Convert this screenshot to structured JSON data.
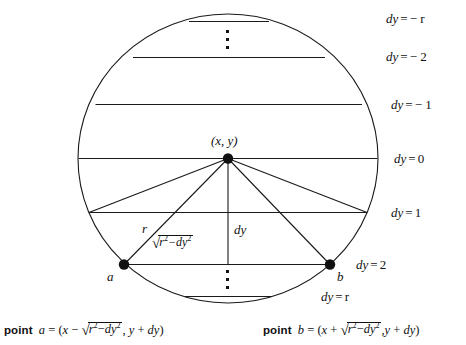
{
  "figure": {
    "center_point_label": "(x, y)",
    "radius_label": "r",
    "dy_label": "dy",
    "chord_half_label_parts": {
      "radicand_base": "r",
      "radicand_exp": "2",
      "minus": "−",
      "second_base": "dy",
      "second_exp": "2"
    },
    "point_a_label": "a",
    "point_b_label": "b"
  },
  "scanlines": [
    {
      "id": "dy-neg-r",
      "label": "dy = − r",
      "var": "dy",
      "eq": "=",
      "value": "− r"
    },
    {
      "id": "dy-neg-2",
      "label": "dy = − 2",
      "var": "dy",
      "eq": "=",
      "value": "− 2"
    },
    {
      "id": "dy-neg-1",
      "label": "dy = − 1",
      "var": "dy",
      "eq": "=",
      "value": "− 1"
    },
    {
      "id": "dy-0",
      "label": "dy = 0",
      "var": "dy",
      "eq": "=",
      "value": "0"
    },
    {
      "id": "dy-1",
      "label": "dy = 1",
      "var": "dy",
      "eq": "=",
      "value": "1"
    },
    {
      "id": "dy-2",
      "label": "dy = 2",
      "var": "dy",
      "eq": "=",
      "value": "2"
    },
    {
      "id": "dy-r",
      "label": "dy = r",
      "var": "dy",
      "eq": "=",
      "value": "r"
    }
  ],
  "captions": {
    "left": {
      "word": "point",
      "name": "a",
      "equals": "=",
      "open": "(",
      "x": "x",
      "sign": "−",
      "radical_base": "r",
      "radical_exp": "2",
      "radical_minus": "−",
      "radical_second": "dy",
      "radical_second_exp": "2",
      "comma": ",",
      "y": "y",
      "plus": "+",
      "dy": "dy",
      "close": ")",
      "full_text": "point a = (x − √(r² − dy²), y + dy)"
    },
    "right": {
      "word": "point",
      "name": "b",
      "equals": "=",
      "open": "(",
      "x": "x",
      "sign": "+",
      "radical_base": "r",
      "radical_exp": "2",
      "radical_minus": "−",
      "radical_second": "dy",
      "radical_second_exp": "2",
      "comma": ",",
      "y": "y",
      "plus": "+",
      "dy": "dy",
      "close": ")",
      "full_text": "point b = (x + √(r² − dy²), y + dy)"
    }
  },
  "colors": {
    "ink": "#111111",
    "background": "#ffffff"
  },
  "vertical_dots": {
    "top": "⋮",
    "bottom": "⋮"
  }
}
